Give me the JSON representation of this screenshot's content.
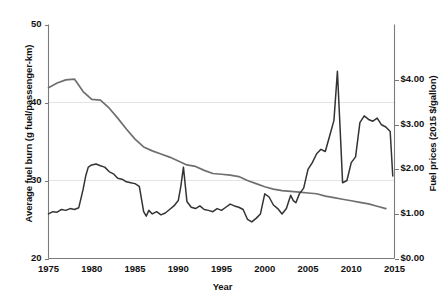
{
  "chart_data": {
    "type": "line",
    "title": "",
    "xlabel": "Year",
    "ylabel_left": "Average fuel burn (g fuel/passenger-km)",
    "ylabel_right": "Fuel prices (2015 $/gallon)",
    "xlim": [
      1975,
      2015
    ],
    "ylim_left": [
      20,
      50
    ],
    "ylim_right": [
      0.0,
      5.25
    ],
    "grid": "horizontal light gridlines at left-axis 30 and 40",
    "legend": "none",
    "xticks": [
      "1975",
      "1980",
      "1985",
      "1990",
      "1995",
      "2000",
      "2005",
      "2010",
      "2015"
    ],
    "xtick_values": [
      1975,
      1980,
      1985,
      1990,
      1995,
      2000,
      2005,
      2010,
      2015
    ],
    "yticks_left": [
      "20",
      "30",
      "40",
      "50"
    ],
    "ytick_values_left": [
      20,
      30,
      40,
      50
    ],
    "yticks_right": [
      "$0.00",
      "$1.00",
      "$2.00",
      "$3.00",
      "$4.00"
    ],
    "ytick_values_right": [
      0.0,
      1.0,
      2.0,
      3.0,
      4.0
    ],
    "series": [
      {
        "name": "Average fuel burn",
        "axis": "left",
        "color": "#6f6f6f",
        "x": [
          1975,
          1976,
          1977,
          1978,
          1979,
          1980,
          1981,
          1982,
          1983,
          1984,
          1985,
          1986,
          1987,
          1988,
          1989,
          1990,
          1991,
          1992,
          1993,
          1994,
          1995,
          1996,
          1997,
          1998,
          1999,
          2000,
          2001,
          2002,
          2003,
          2004,
          2005,
          2006,
          2007,
          2008,
          2009,
          2010,
          2011,
          2012,
          2013,
          2014
        ],
        "values": [
          41.9,
          42.5,
          42.9,
          43.0,
          41.4,
          40.4,
          40.3,
          39.3,
          38.0,
          36.6,
          35.3,
          34.3,
          33.8,
          33.4,
          33.0,
          32.5,
          32.0,
          31.8,
          31.3,
          30.9,
          30.8,
          30.7,
          30.5,
          30.0,
          29.6,
          29.2,
          28.9,
          28.7,
          28.6,
          28.5,
          28.4,
          28.3,
          28.0,
          27.8,
          27.6,
          27.4,
          27.2,
          27.0,
          26.7,
          26.4
        ]
      },
      {
        "name": "Fuel prices",
        "axis": "right",
        "color": "#333333",
        "x": [
          1975.0,
          1975.5,
          1976.0,
          1976.5,
          1977.0,
          1977.5,
          1978.0,
          1978.5,
          1979.0,
          1979.3,
          1979.6,
          1980.0,
          1980.5,
          1981.0,
          1981.5,
          1982.0,
          1982.5,
          1983.0,
          1983.5,
          1984.0,
          1984.5,
          1985.0,
          1985.5,
          1986.0,
          1986.3,
          1986.6,
          1987.0,
          1987.5,
          1988.0,
          1988.5,
          1989.0,
          1989.5,
          1990.0,
          1990.3,
          1990.6,
          1991.0,
          1991.5,
          1992.0,
          1992.5,
          1993.0,
          1993.5,
          1994.0,
          1994.5,
          1995.0,
          1995.5,
          1996.0,
          1996.5,
          1997.0,
          1997.5,
          1998.0,
          1998.5,
          1999.0,
          1999.5,
          2000.0,
          2000.5,
          2001.0,
          2001.5,
          2002.0,
          2002.5,
          2003.0,
          2003.3,
          2003.6,
          2004.0,
          2004.5,
          2005.0,
          2005.5,
          2006.0,
          2006.5,
          2007.0,
          2007.5,
          2008.0,
          2008.4,
          2008.8,
          2009.0,
          2009.5,
          2010.0,
          2010.5,
          2011.0,
          2011.5,
          2012.0,
          2012.5,
          2013.0,
          2013.5,
          2014.0,
          2014.5,
          2014.8
        ],
        "values": [
          1.0,
          1.05,
          1.04,
          1.1,
          1.08,
          1.12,
          1.1,
          1.14,
          1.55,
          1.85,
          2.05,
          2.1,
          2.12,
          2.08,
          2.05,
          1.95,
          1.9,
          1.8,
          1.78,
          1.72,
          1.7,
          1.68,
          1.62,
          1.05,
          0.95,
          1.08,
          1.0,
          1.05,
          0.98,
          1.02,
          1.1,
          1.18,
          1.3,
          1.62,
          2.05,
          1.28,
          1.15,
          1.12,
          1.18,
          1.1,
          1.08,
          1.05,
          1.12,
          1.08,
          1.15,
          1.22,
          1.18,
          1.15,
          1.1,
          0.88,
          0.82,
          0.9,
          1.0,
          1.45,
          1.38,
          1.2,
          1.12,
          1.0,
          1.12,
          1.42,
          1.3,
          1.25,
          1.45,
          1.58,
          2.0,
          2.15,
          2.35,
          2.45,
          2.4,
          2.75,
          3.1,
          4.2,
          2.55,
          1.7,
          1.75,
          2.15,
          2.28,
          3.05,
          3.2,
          3.12,
          3.08,
          3.15,
          3.0,
          2.95,
          2.85,
          1.85
        ]
      }
    ]
  },
  "figure": {
    "background": "#ffffff",
    "axis_color": "#7a7a7a",
    "gridline_color": "#e4e4e4",
    "text_color": "#111111"
  }
}
